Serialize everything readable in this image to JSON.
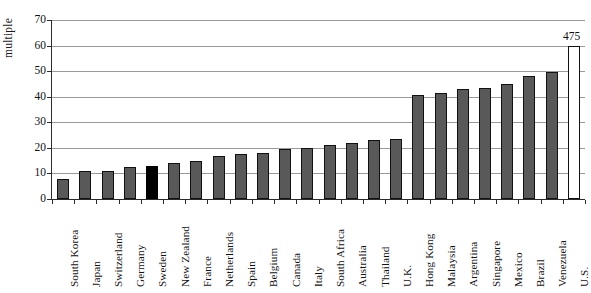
{
  "chart_data": {
    "type": "bar",
    "title": "",
    "xlabel": "",
    "ylabel": "multiple",
    "ylim": [
      0,
      70
    ],
    "ytick_step": 10,
    "yticks": [
      0,
      10,
      20,
      30,
      40,
      50,
      60,
      70
    ],
    "grid": true,
    "legend": "none",
    "categories": [
      "South Korea",
      "Japan",
      "Switzerland",
      "Germany",
      "Sweden",
      "New Zealand",
      "France",
      "Netherlands",
      "Spain",
      "Belgium",
      "Canada",
      "Italy",
      "South Africa",
      "Australia",
      "Thailand",
      "U.K.",
      "Hong Kong",
      "Malaysia",
      "Argentina",
      "Singapore",
      "Mexico",
      "Brazil",
      "Venezuela",
      "U.S."
    ],
    "values": [
      8,
      11,
      11,
      12.5,
      13,
      14,
      15,
      17,
      17.5,
      18,
      19.5,
      20,
      21,
      22,
      23,
      23.5,
      40.5,
      41.5,
      43,
      43.5,
      45,
      48,
      49.5,
      60
    ],
    "bar_styles": [
      "gray",
      "gray",
      "gray",
      "gray",
      "black",
      "gray",
      "gray",
      "gray",
      "gray",
      "gray",
      "gray",
      "gray",
      "gray",
      "gray",
      "gray",
      "gray",
      "gray",
      "gray",
      "gray",
      "gray",
      "gray",
      "gray",
      "gray",
      "hollow"
    ],
    "data_labels": {
      "U.S.": "475"
    },
    "notes": {
      "truncated_bar": "U.S.",
      "truncated_actual_value": 475,
      "truncated_drawn_to": 60
    }
  },
  "colors": {
    "bar_gray": "#595959",
    "bar_black": "#000000",
    "bar_hollow": "#ffffff",
    "bar_border": "#111111",
    "gridline": "#9a9a9a",
    "axis": "#2b2b2b",
    "text": "#111111",
    "background": "#ffffff"
  }
}
